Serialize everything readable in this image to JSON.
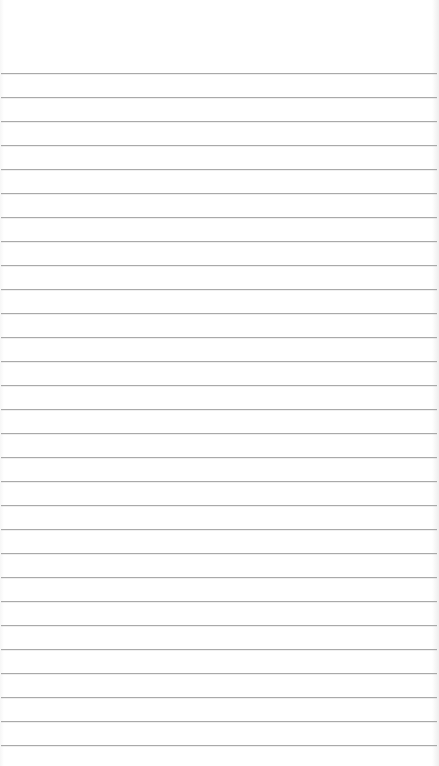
{
  "page": {
    "type": "lined-paper",
    "background_color": "#ffffff",
    "line_color": "#a9a9a9",
    "first_line_y": 73,
    "line_spacing": 24,
    "line_count": 29
  }
}
